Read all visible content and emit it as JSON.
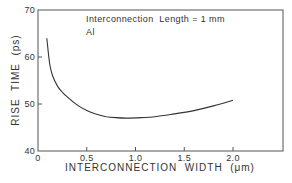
{
  "chart_data": {
    "type": "line",
    "title": "",
    "annotations": [
      "Interconnection  Length = 1 mm",
      "Al"
    ],
    "xlabel": "INTERCONNECTION  WIDTH  (μm)",
    "ylabel": "RISE  TIME  (ps)",
    "xlim": [
      0,
      2.5
    ],
    "ylim": [
      40,
      70
    ],
    "xticks": [
      0,
      0.5,
      1.0,
      1.5,
      2.0
    ],
    "xtick_labels": [
      "0",
      "0.5",
      "1.0",
      "1.5",
      "2.0"
    ],
    "yticks": [
      40,
      50,
      60,
      70
    ],
    "ytick_labels": [
      "40",
      "50",
      "60",
      "70"
    ],
    "grid": false,
    "legend": null,
    "series": [
      {
        "name": "Al, 1 mm",
        "x": [
          0.09,
          0.12,
          0.15,
          0.2,
          0.25,
          0.3,
          0.4,
          0.5,
          0.6,
          0.7,
          0.8,
          0.9,
          1.0,
          1.2,
          1.4,
          1.6,
          1.8,
          2.0
        ],
        "values": [
          64.0,
          58.5,
          56.0,
          53.8,
          52.5,
          51.5,
          49.8,
          48.6,
          47.8,
          47.3,
          47.1,
          47.0,
          47.05,
          47.3,
          47.9,
          48.6,
          49.6,
          50.8
        ]
      }
    ]
  }
}
